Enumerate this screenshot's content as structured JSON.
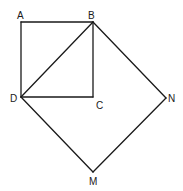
{
  "diagram": {
    "type": "geometry",
    "points": {
      "A": {
        "label": "A",
        "x": 21,
        "y": 22
      },
      "B": {
        "label": "B",
        "x": 93,
        "y": 22
      },
      "C": {
        "label": "C",
        "x": 93,
        "y": 97
      },
      "D": {
        "label": "D",
        "x": 21,
        "y": 97
      },
      "N": {
        "label": "N",
        "x": 166,
        "y": 98
      },
      "M": {
        "label": "M",
        "x": 93,
        "y": 172
      }
    },
    "segments": [
      [
        "A",
        "B"
      ],
      [
        "A",
        "D"
      ],
      [
        "B",
        "C"
      ],
      [
        "D",
        "C"
      ],
      [
        "D",
        "B"
      ],
      [
        "B",
        "N"
      ],
      [
        "N",
        "M"
      ],
      [
        "M",
        "D"
      ]
    ],
    "labels": {
      "A": "A",
      "B": "B",
      "C": "C",
      "D": "D",
      "N": "N",
      "M": "M"
    },
    "colors": {
      "stroke": "#1a1a1a",
      "background": "#ffffff"
    }
  }
}
